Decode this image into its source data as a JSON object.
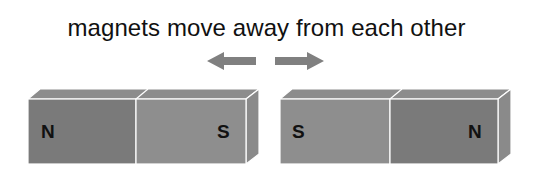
{
  "title": "magnets move away from each other",
  "arrows": [
    {
      "direction": "left",
      "color": "#808080"
    },
    {
      "direction": "right",
      "color": "#808080"
    }
  ],
  "magnets": [
    {
      "name": "left-magnet",
      "poles": [
        {
          "label": "N",
          "color": "#7a7a7a"
        },
        {
          "label": "S",
          "color": "#8e8e8e"
        }
      ]
    },
    {
      "name": "right-magnet",
      "poles": [
        {
          "label": "S",
          "color": "#8e8e8e"
        },
        {
          "label": "N",
          "color": "#7a7a7a"
        }
      ]
    }
  ],
  "colors": {
    "top_face": "#8c8c8c",
    "side_face": "#8a8a8a",
    "edge": "#ffffff"
  }
}
